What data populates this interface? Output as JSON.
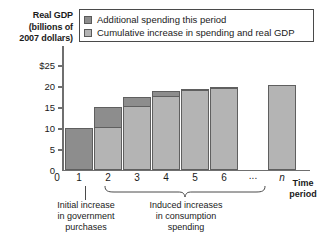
{
  "chart_data": {
    "type": "bar",
    "title": "",
    "ylabel": "Real GDP (billions of 2007 dollars)",
    "xlabel": "Time period",
    "ylim": [
      0,
      27
    ],
    "yticks": [
      0,
      5,
      10,
      15,
      20,
      25
    ],
    "ytick_labels": [
      "0",
      "5",
      "10",
      "15",
      "20",
      "$25"
    ],
    "categories": [
      "1",
      "2",
      "3",
      "4",
      "5",
      "6",
      "...",
      "n"
    ],
    "grid": false,
    "legend_position": "top",
    "series": [
      {
        "name": "Additional spending this period",
        "color": "#8d8d8d",
        "values": [
          10.0,
          5.0,
          2.5,
          1.3,
          0.6,
          0.3,
          null,
          0.0
        ]
      },
      {
        "name": "Cumulative increase in spending and real GDP",
        "color": "#b4b4b4",
        "values": [
          10.0,
          15.0,
          17.5,
          18.8,
          19.4,
          19.9,
          null,
          20.4
        ]
      }
    ],
    "bars": [
      {
        "label": "1",
        "cumulative": 10.0,
        "additional": 10.0,
        "base": 0.0,
        "all_dark": true
      },
      {
        "label": "2",
        "cumulative": 15.0,
        "additional": 5.0,
        "base": 10.0,
        "all_dark": false
      },
      {
        "label": "3",
        "cumulative": 17.5,
        "additional": 2.5,
        "base": 15.0,
        "all_dark": false
      },
      {
        "label": "4",
        "cumulative": 18.8,
        "additional": 1.3,
        "base": 17.5,
        "all_dark": false
      },
      {
        "label": "5",
        "cumulative": 19.4,
        "additional": 0.6,
        "base": 18.8,
        "all_dark": false
      },
      {
        "label": "6",
        "cumulative": 19.9,
        "additional": 0.5,
        "base": 19.4,
        "all_dark": false
      },
      {
        "label": "...",
        "cumulative": null,
        "additional": null,
        "base": null,
        "gap": true
      },
      {
        "label": "n",
        "cumulative": 20.4,
        "additional": 0.0,
        "base": 20.4,
        "all_dark": false
      }
    ],
    "annotations": [
      {
        "id": "initial",
        "text": "Initial increase in government purchases",
        "points_to": "1"
      },
      {
        "id": "induced",
        "text": "Induced increases in consumption spending",
        "points_to": "2-n"
      }
    ]
  },
  "axis": {
    "y_title_lines": [
      "Real GDP",
      "(billions of",
      "2007 dollars)"
    ],
    "x_title_lines": [
      "Time",
      "period"
    ],
    "zero_label": "0"
  },
  "legend": {
    "items": [
      {
        "label": "Additional spending this period",
        "swatch": "dark-swatch"
      },
      {
        "label": "Cumulative increase in spending and real GDP",
        "swatch": "light-swatch"
      }
    ]
  },
  "annotations": {
    "initial": {
      "lines": [
        "Initial increase",
        "in government",
        "purchases"
      ]
    },
    "induced": {
      "lines": [
        "Induced increases",
        "in consumption",
        "spending"
      ]
    }
  }
}
